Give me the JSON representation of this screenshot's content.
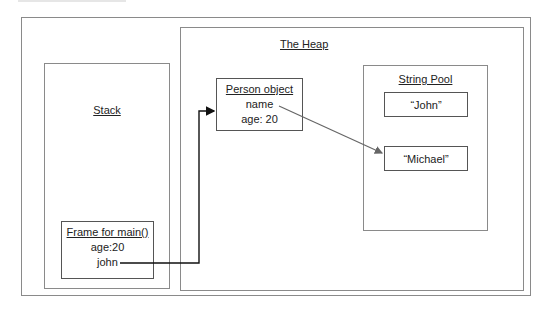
{
  "diagram": {
    "heap": {
      "title": "The Heap",
      "person_object": {
        "title": "Person object",
        "fields": [
          "name",
          "age: 20"
        ]
      },
      "string_pool": {
        "title": "String Pool",
        "strings": [
          "“John”",
          "“Michael”"
        ]
      }
    },
    "stack": {
      "title": "Stack",
      "frame": {
        "title": "Frame for main()",
        "fields": [
          "age:20",
          "john"
        ]
      }
    },
    "arrows": [
      {
        "from": "stack.frame.john",
        "to": "heap.person_object",
        "color": "#111111"
      },
      {
        "from": "heap.person_object.name",
        "to": "heap.string_pool.Michael",
        "color": "#666666"
      }
    ]
  }
}
